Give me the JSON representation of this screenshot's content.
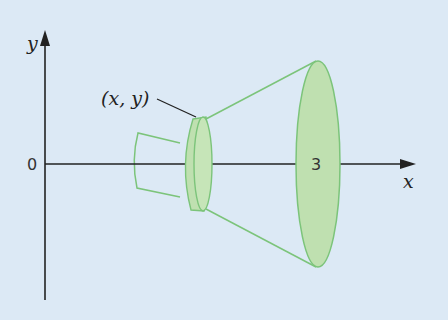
{
  "figure": {
    "axes": {
      "x_label": "x",
      "y_label": "y",
      "origin_label": "0"
    },
    "annotations": {
      "point_label": "(x, y)",
      "x_tick_label": "3"
    },
    "colors": {
      "background": "#dce9f5",
      "solid_fill": "#bfe0b0",
      "solid_stroke": "#7cc47a",
      "axis": "#222222"
    }
  }
}
